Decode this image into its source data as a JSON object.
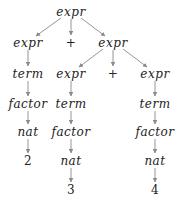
{
  "diagram": {
    "type": "parse-tree",
    "edge_color": "#8a8a8a",
    "text_color": "#222222",
    "nodes": [
      {
        "id": "n0",
        "label": "expr",
        "x": 71,
        "y": 12,
        "italic": true
      },
      {
        "id": "n1",
        "label": "expr",
        "x": 28,
        "y": 43,
        "italic": true
      },
      {
        "id": "n2",
        "label": "+",
        "x": 71,
        "y": 43,
        "italic": false
      },
      {
        "id": "n3",
        "label": "expr",
        "x": 113,
        "y": 43,
        "italic": true
      },
      {
        "id": "n4",
        "label": "term",
        "x": 28,
        "y": 74,
        "italic": true
      },
      {
        "id": "n5",
        "label": "expr",
        "x": 71,
        "y": 74,
        "italic": true
      },
      {
        "id": "n6",
        "label": "+",
        "x": 113,
        "y": 74,
        "italic": false
      },
      {
        "id": "n7",
        "label": "expr",
        "x": 155,
        "y": 74,
        "italic": true
      },
      {
        "id": "n8",
        "label": "factor",
        "x": 28,
        "y": 104,
        "italic": true
      },
      {
        "id": "n9",
        "label": "term",
        "x": 71,
        "y": 104,
        "italic": true
      },
      {
        "id": "n10",
        "label": "term",
        "x": 155,
        "y": 104,
        "italic": true
      },
      {
        "id": "n11",
        "label": "nat",
        "x": 28,
        "y": 132,
        "italic": true
      },
      {
        "id": "n12",
        "label": "factor",
        "x": 71,
        "y": 132,
        "italic": true
      },
      {
        "id": "n13",
        "label": "factor",
        "x": 155,
        "y": 132,
        "italic": true
      },
      {
        "id": "n14",
        "label": "2",
        "x": 28,
        "y": 161,
        "italic": false
      },
      {
        "id": "n15",
        "label": "nat",
        "x": 71,
        "y": 161,
        "italic": true
      },
      {
        "id": "n16",
        "label": "nat",
        "x": 155,
        "y": 161,
        "italic": true
      },
      {
        "id": "n17",
        "label": "3",
        "x": 71,
        "y": 190,
        "italic": false
      },
      {
        "id": "n18",
        "label": "4",
        "x": 155,
        "y": 190,
        "italic": false
      }
    ],
    "edges": [
      {
        "from": "n0",
        "to": "n1"
      },
      {
        "from": "n0",
        "to": "n2"
      },
      {
        "from": "n0",
        "to": "n3"
      },
      {
        "from": "n1",
        "to": "n4"
      },
      {
        "from": "n3",
        "to": "n5"
      },
      {
        "from": "n3",
        "to": "n6"
      },
      {
        "from": "n3",
        "to": "n7"
      },
      {
        "from": "n4",
        "to": "n8"
      },
      {
        "from": "n5",
        "to": "n9"
      },
      {
        "from": "n7",
        "to": "n10"
      },
      {
        "from": "n8",
        "to": "n11"
      },
      {
        "from": "n9",
        "to": "n12"
      },
      {
        "from": "n10",
        "to": "n13"
      },
      {
        "from": "n11",
        "to": "n14"
      },
      {
        "from": "n12",
        "to": "n15"
      },
      {
        "from": "n13",
        "to": "n16"
      },
      {
        "from": "n15",
        "to": "n17"
      },
      {
        "from": "n16",
        "to": "n18"
      }
    ]
  }
}
